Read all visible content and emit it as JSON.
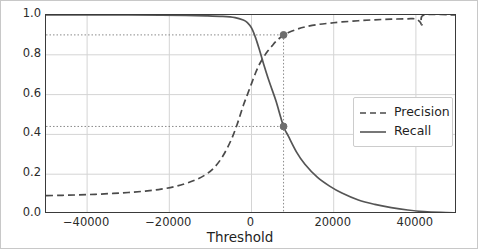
{
  "chart_data": {
    "type": "line",
    "title": "",
    "xlabel": "Threshold",
    "ylabel": "",
    "xlim": [
      -50000,
      50000
    ],
    "ylim": [
      0.0,
      1.0
    ],
    "grid": true,
    "legend_position": "center-right",
    "xticks": [
      -40000,
      -20000,
      0,
      20000,
      40000
    ],
    "xticklabels": [
      "−40000",
      "−20000",
      "0",
      "20000",
      "40000"
    ],
    "yticks": [
      0.0,
      0.2,
      0.4,
      0.6,
      0.8,
      1.0
    ],
    "yticklabels": [
      "0.0",
      "0.2",
      "0.4",
      "0.6",
      "0.8",
      "1.0"
    ],
    "series": [
      {
        "name": "Precision",
        "style": "dashed",
        "color": "#4a4a4a",
        "x": [
          -50000,
          -46000,
          -42000,
          -38000,
          -34000,
          -30000,
          -26000,
          -22000,
          -18000,
          -14000,
          -11000,
          -9000,
          -7000,
          -5000,
          -3500,
          -2000,
          -1000,
          0,
          1000,
          2000,
          3000,
          4000,
          5000,
          6000,
          7800,
          9000,
          11000,
          13000,
          16000,
          19000,
          22000,
          26000,
          30000,
          34000,
          38000,
          40000,
          41000,
          41500,
          42000,
          50000
        ],
        "y": [
          0.092,
          0.094,
          0.096,
          0.099,
          0.103,
          0.108,
          0.115,
          0.125,
          0.141,
          0.168,
          0.2,
          0.235,
          0.29,
          0.37,
          0.45,
          0.545,
          0.6,
          0.655,
          0.71,
          0.755,
          0.79,
          0.82,
          0.845,
          0.868,
          0.9,
          0.912,
          0.928,
          0.94,
          0.952,
          0.959,
          0.965,
          0.971,
          0.976,
          0.979,
          0.981,
          0.98,
          0.965,
          0.952,
          1.0,
          1.0
        ]
      },
      {
        "name": "Recall",
        "style": "solid",
        "color": "#555555",
        "x": [
          -50000,
          -40000,
          -30000,
          -22000,
          -16000,
          -11000,
          -7000,
          -4000,
          -2000,
          -1000,
          0,
          1000,
          2000,
          3000,
          4000,
          5000,
          6000,
          7800,
          9000,
          11000,
          13000,
          16000,
          19000,
          22000,
          26000,
          30000,
          34000,
          38000,
          42000,
          46000,
          50000
        ],
        "y": [
          1.0,
          1.0,
          1.0,
          0.999,
          0.998,
          0.996,
          0.993,
          0.987,
          0.975,
          0.962,
          0.935,
          0.885,
          0.82,
          0.75,
          0.685,
          0.625,
          0.565,
          0.44,
          0.39,
          0.31,
          0.25,
          0.185,
          0.14,
          0.105,
          0.07,
          0.048,
          0.032,
          0.02,
          0.012,
          0.008,
          0.006
        ]
      }
    ],
    "annotations": {
      "threshold_marker_x": 7800,
      "precision_at_threshold": 0.9,
      "recall_at_threshold": 0.44,
      "guide_lines": [
        "vertical at threshold 7800",
        "horizontal at 0.90",
        "horizontal at 0.44"
      ],
      "marker_color": "#6e6e6e"
    }
  },
  "legend": {
    "items": [
      {
        "label": "Precision",
        "style": "dashed"
      },
      {
        "label": "Recall",
        "style": "solid"
      }
    ]
  }
}
